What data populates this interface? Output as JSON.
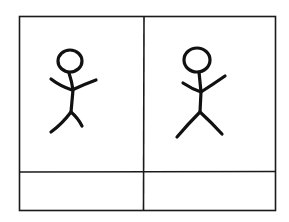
{
  "diagram": {
    "type": "storyboard-two-panel",
    "panels": [
      {
        "id": "panel-1",
        "figure": "stick-figure",
        "pose": "arms-raised-legs-bent",
        "caption": ""
      },
      {
        "id": "panel-2",
        "figure": "stick-figure",
        "pose": "arms-raised-legs-apart",
        "caption": ""
      }
    ],
    "colors": {
      "ink": "#111111",
      "paper": "#ffffff"
    }
  }
}
